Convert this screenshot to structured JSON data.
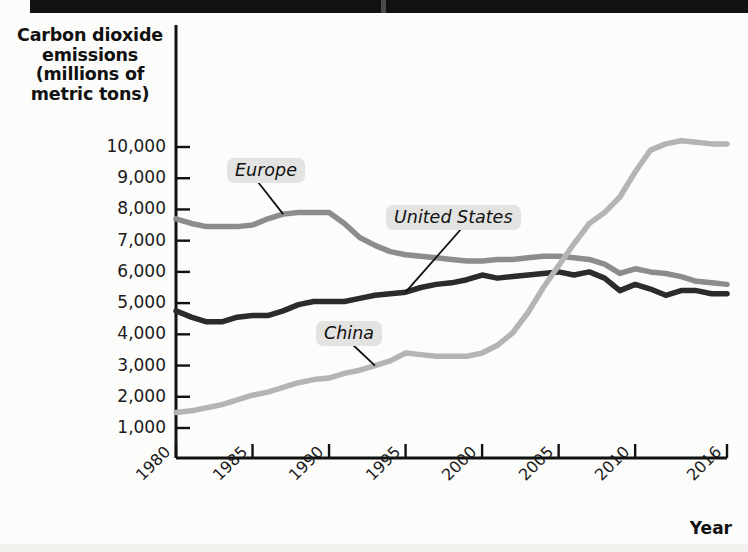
{
  "page": {
    "background_color": "#fcfcfa",
    "top_bar_color": "#111111"
  },
  "chart_data": {
    "type": "line",
    "title": "",
    "ylabel": "Carbon dioxide emissions (millions of metric tons)",
    "ylabel_lines": [
      "Carbon dioxide",
      "emissions",
      "(millions of",
      "metric tons)"
    ],
    "xlabel": "Year",
    "grid": false,
    "legend_position": "inline-annotations",
    "xlim": [
      1980,
      2016
    ],
    "ylim": [
      0,
      10600
    ],
    "ytick_labels": [
      "10,000",
      "9,000",
      "8,000",
      "7,000",
      "6,000",
      "5,000",
      "4,000",
      "3,000",
      "2,000",
      "1,000"
    ],
    "ytick_values": [
      10000,
      9000,
      8000,
      7000,
      6000,
      5000,
      4000,
      3000,
      2000,
      1000
    ],
    "xtick_labels": [
      "1980",
      "1985",
      "1990",
      "1995",
      "2000",
      "2005",
      "2010",
      "2016"
    ],
    "xtick_values": [
      1980,
      1985,
      1990,
      1995,
      2000,
      2005,
      2010,
      2016
    ],
    "x": [
      1980,
      1981,
      1982,
      1983,
      1984,
      1985,
      1986,
      1987,
      1988,
      1989,
      1990,
      1991,
      1992,
      1993,
      1994,
      1995,
      1996,
      1997,
      1998,
      1999,
      2000,
      2001,
      2002,
      2003,
      2004,
      2005,
      2006,
      2007,
      2008,
      2009,
      2010,
      2011,
      2012,
      2013,
      2014,
      2015,
      2016
    ],
    "series": [
      {
        "name": "Europe",
        "color": "#8c8c8c",
        "values": [
          7700,
          7550,
          7450,
          7450,
          7450,
          7500,
          7700,
          7850,
          7900,
          7900,
          7900,
          7550,
          7100,
          6850,
          6650,
          6550,
          6500,
          6450,
          6400,
          6350,
          6350,
          6400,
          6400,
          6450,
          6500,
          6500,
          6450,
          6400,
          6250,
          5950,
          6100,
          6000,
          5950,
          5850,
          5700,
          5650,
          5600
        ]
      },
      {
        "name": "United States",
        "color": "#2b2b2b",
        "values": [
          4750,
          4550,
          4400,
          4400,
          4550,
          4600,
          4600,
          4750,
          4950,
          5050,
          5050,
          5050,
          5150,
          5250,
          5300,
          5350,
          5500,
          5600,
          5650,
          5750,
          5900,
          5800,
          5850,
          5900,
          5950,
          6000,
          5900,
          6000,
          5800,
          5400,
          5600,
          5450,
          5250,
          5400,
          5400,
          5300,
          5300
        ]
      },
      {
        "name": "China",
        "color": "#b4b4b4",
        "values": [
          1500,
          1550,
          1650,
          1750,
          1900,
          2050,
          2150,
          2300,
          2450,
          2550,
          2600,
          2750,
          2850,
          3000,
          3150,
          3400,
          3350,
          3300,
          3300,
          3300,
          3400,
          3650,
          4050,
          4700,
          5500,
          6200,
          6900,
          7550,
          7900,
          8400,
          9200,
          9900,
          10100,
          10200,
          10150,
          10100,
          10100
        ]
      }
    ],
    "annotations": [
      {
        "label": "Europe",
        "points_to_series": "Europe",
        "points_to_year": 1987
      },
      {
        "label": "United States",
        "points_to_series": "United States",
        "points_to_year": 1995
      },
      {
        "label": "China",
        "points_to_series": "China",
        "points_to_year": 1993
      }
    ]
  }
}
